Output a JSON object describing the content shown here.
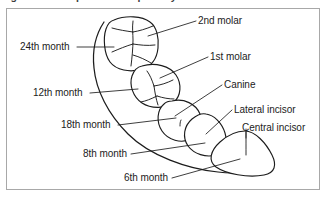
{
  "figure": {
    "caption": "Figure 1-2. Eruption of the primary teeth",
    "caption_visible_note": "clipped at top edge",
    "type": "anatomical-diagram"
  },
  "colors": {
    "ink": "#1c1c1c",
    "frame": "#a8a8a8",
    "background": "#ffffff",
    "caption": "#3c3c3c"
  },
  "tooth_labels": [
    {
      "id": "second-molar",
      "text": "2nd molar"
    },
    {
      "id": "first-molar",
      "text": "1st molar"
    },
    {
      "id": "canine",
      "text": "Canine"
    },
    {
      "id": "lateral-incisor",
      "text": "Lateral incisor"
    },
    {
      "id": "central-incisor",
      "text": "Central incisor"
    }
  ],
  "age_labels": [
    {
      "id": "month-24",
      "text": "24th month"
    },
    {
      "id": "month-12",
      "text": "12th month"
    },
    {
      "id": "month-18",
      "text": "18th month"
    },
    {
      "id": "month-8",
      "text": "8th month"
    },
    {
      "id": "month-6",
      "text": "6th month"
    }
  ],
  "teeth": [
    {
      "id": "second-molar",
      "shape": "rounded-square-occlusal",
      "eruption": "24th month"
    },
    {
      "id": "first-molar",
      "shape": "rounded-occlusal",
      "eruption": "12th month"
    },
    {
      "id": "canine",
      "shape": "oval",
      "eruption": "18th month"
    },
    {
      "id": "lateral-incisor",
      "shape": "rounded-triangle",
      "eruption": "8th month"
    },
    {
      "id": "central-incisor",
      "shape": "wide-dome",
      "eruption": "6th month"
    }
  ]
}
